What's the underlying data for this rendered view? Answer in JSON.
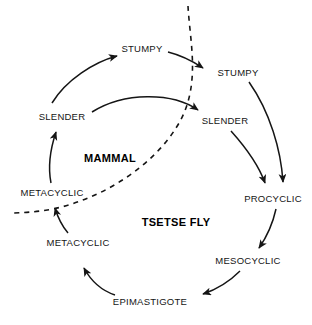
{
  "diagram": {
    "background_color": "#ffffff",
    "stroke_color": "#151515",
    "zones": [
      {
        "id": "mammal",
        "label": "MAMMAL",
        "x": 110,
        "y": 158
      },
      {
        "id": "tsetse",
        "label": "TSETSE FLY",
        "x": 176,
        "y": 222
      }
    ],
    "nodes": [
      {
        "id": "mammal-stumpy",
        "label": "STUMPY",
        "x": 142,
        "y": 48
      },
      {
        "id": "fly-stumpy",
        "label": "STUMPY",
        "x": 238,
        "y": 72
      },
      {
        "id": "mammal-slender",
        "label": "SLENDER",
        "x": 62,
        "y": 116
      },
      {
        "id": "fly-slender",
        "label": "SLENDER",
        "x": 225,
        "y": 120
      },
      {
        "id": "mammal-metacyclic",
        "label": "METACYCLIC",
        "x": 52,
        "y": 192
      },
      {
        "id": "fly-procyclic",
        "label": "PROCYCLIC",
        "x": 273,
        "y": 198
      },
      {
        "id": "fly-metacyclic",
        "label": "METACYCLIC",
        "x": 78,
        "y": 242
      },
      {
        "id": "fly-mesocyclic",
        "label": "MESOCYCLIC",
        "x": 248,
        "y": 260
      },
      {
        "id": "fly-epimastigote",
        "label": "EPIMASTIGOTE",
        "x": 150,
        "y": 301
      }
    ],
    "edges": [
      {
        "id": "slender-to-stumpy-mammal",
        "from": "mammal-slender",
        "to": "mammal-stumpy",
        "style": "solid"
      },
      {
        "id": "stumpy-to-stumpy",
        "from": "mammal-stumpy",
        "to": "fly-stumpy",
        "style": "solid"
      },
      {
        "id": "slender-to-slender",
        "from": "mammal-slender",
        "to": "fly-slender",
        "style": "solid"
      },
      {
        "id": "stumpy-to-procyclic",
        "from": "fly-stumpy",
        "to": "fly-procyclic",
        "style": "solid"
      },
      {
        "id": "slender-to-procyclic",
        "from": "fly-slender",
        "to": "fly-procyclic",
        "style": "solid"
      },
      {
        "id": "procyclic-to-mesocyclic",
        "from": "fly-procyclic",
        "to": "fly-mesocyclic",
        "style": "solid"
      },
      {
        "id": "mesocyclic-to-epimastigote",
        "from": "fly-mesocyclic",
        "to": "fly-epimastigote",
        "style": "solid"
      },
      {
        "id": "epimastigote-to-metacyclic",
        "from": "fly-epimastigote",
        "to": "fly-metacyclic",
        "style": "solid"
      },
      {
        "id": "metacyclic-to-metacyclic",
        "from": "fly-metacyclic",
        "to": "mammal-metacyclic",
        "style": "solid"
      },
      {
        "id": "metacyclic-to-slender",
        "from": "mammal-metacyclic",
        "to": "mammal-slender",
        "style": "solid"
      },
      {
        "id": "host-boundary",
        "from": "top",
        "to": "left",
        "style": "dashed"
      }
    ]
  }
}
